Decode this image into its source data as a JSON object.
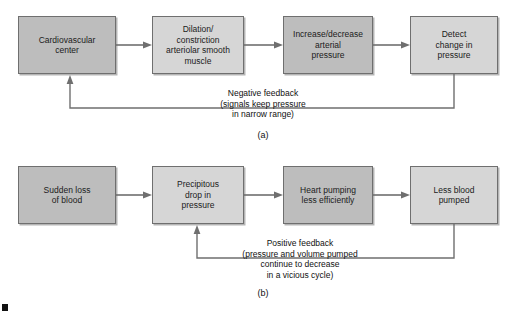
{
  "figure": {
    "panels": [
      {
        "id": "a",
        "label": "(a)",
        "boxes": [
          {
            "name": "cardiovascular-center",
            "text": "Cardiovascular\ncenter"
          },
          {
            "name": "dilation-constriction",
            "text": "Dilation/\nconstriction\narteriolar smooth\nmuscle"
          },
          {
            "name": "increase-decrease-arterial-pressure",
            "text": "Increase/decrease\narterial\npressure"
          },
          {
            "name": "detect-change-in-pressure",
            "text": "Detect\nchange in\npressure"
          }
        ],
        "feedback_caption": "Negative feedback\n(signals keep pressure\nin narrow range)"
      },
      {
        "id": "b",
        "label": "(b)",
        "boxes": [
          {
            "name": "sudden-loss-of-blood",
            "text": "Sudden loss\nof blood"
          },
          {
            "name": "precipitous-drop-in-pressure",
            "text": "Precipitous\ndrop in\npressure"
          },
          {
            "name": "heart-pumping-less-efficiently",
            "text": "Heart pumping\nless efficiently"
          },
          {
            "name": "less-blood-pumped",
            "text": "Less blood\npumped"
          }
        ],
        "feedback_caption": "Positive feedback\n(pressure and volume pumped\ncontinue to decrease\nin a vicious cycle)"
      }
    ]
  },
  "colors": {
    "box_fill": "#c9c9c9",
    "box_fill_light": "#d6d6d6",
    "box_border": "#6f6f6f",
    "line": "#6f6f6f",
    "text": "#111111",
    "background": "#ffffff"
  }
}
